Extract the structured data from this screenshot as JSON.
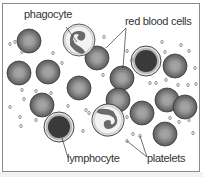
{
  "diagram": {
    "type": "labeled illustration",
    "subject": "blood cells",
    "labels": {
      "phagocyte": "phagocyte",
      "red_blood_cells": "red blood cells",
      "lymphocyte": "lymphocyte",
      "platelets": "platelets"
    },
    "colors": {
      "rbc_rim": "#5a5a5a",
      "rbc_body": "#8c8c8c",
      "rbc_center": "#a8a8a8",
      "lymphocyte_nucleus": "#3a3a3a",
      "phagocyte_cytoplasm": "#efefef",
      "outline": "#333333"
    }
  }
}
